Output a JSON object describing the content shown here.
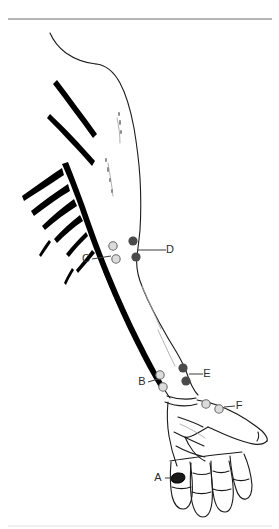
{
  "figure": {
    "kind": "anatomy-illustration",
    "width": 279,
    "height": 529,
    "background_color": "#ffffff",
    "top_rule": {
      "name": "horizontal-rule",
      "color": "#6e6e6e",
      "x1": 8,
      "x2": 272,
      "y": 19,
      "thickness": 1.2
    },
    "bottom_rule": {
      "name": "bottom-horizontal-rule",
      "color": "#d8d8d8",
      "x1": 8,
      "x2": 272,
      "y": 526,
      "thickness": 0.8
    },
    "colors": {
      "outline": "#1a1a1a",
      "nerve_tree": "#000000",
      "filled_marker": "#4a4a4a",
      "open_marker_fill": "#dcdcdc",
      "open_marker_stroke": "#6a6a6a",
      "label_text": "#2b2b2b",
      "leader_line": "#3a3a3a",
      "faint_detail": "#9a9a9a",
      "rule": "#6e6e6e"
    }
  },
  "markers": [
    {
      "id": "A",
      "label": "A",
      "type": "filled-band",
      "description": "dark band around the index finger proximal phalanx",
      "cx": 178,
      "cy": 478,
      "rx": 7,
      "ry": 5,
      "rotation": -12,
      "label_x": 158,
      "label_y": 478,
      "leader": {
        "x1": 165,
        "y1": 478,
        "x2": 172,
        "y2": 478
      }
    },
    {
      "id": "B",
      "label": "B",
      "type": "open-circles",
      "description": "two open circles on the ulnar side of the wrist",
      "circles": [
        {
          "cx": 160,
          "cy": 375,
          "r": 4.2
        },
        {
          "cx": 163,
          "cy": 387,
          "r": 4.2
        }
      ],
      "label_x": 142,
      "label_y": 382,
      "leader": {
        "x1": 148,
        "y1": 382,
        "x2": 158,
        "y2": 379
      }
    },
    {
      "id": "C",
      "label": "C",
      "type": "open-circles",
      "description": "two open circles medial to the elbow crease",
      "circles": [
        {
          "cx": 113,
          "cy": 246,
          "r": 4.2
        },
        {
          "cx": 116,
          "cy": 259,
          "r": 4.2
        }
      ],
      "label_x": 86,
      "label_y": 259,
      "leader": {
        "x1": 92,
        "y1": 259,
        "x2": 111,
        "y2": 256
      }
    },
    {
      "id": "D",
      "label": "D",
      "type": "filled-circles",
      "description": "two filled circles lateral to the elbow",
      "circles": [
        {
          "cx": 133,
          "cy": 241,
          "r": 4.6
        },
        {
          "cx": 136,
          "cy": 257,
          "r": 4.6
        }
      ],
      "label_x": 170,
      "label_y": 250,
      "leader": {
        "x1": 138,
        "y1": 250,
        "x2": 166,
        "y2": 250
      }
    },
    {
      "id": "E",
      "label": "E",
      "type": "filled-circles",
      "description": "two filled circles on the distal forearm near the wrist",
      "circles": [
        {
          "cx": 183,
          "cy": 368,
          "r": 4.6
        },
        {
          "cx": 186,
          "cy": 381,
          "r": 4.6
        }
      ],
      "label_x": 207,
      "label_y": 374,
      "leader": {
        "x1": 189,
        "y1": 374,
        "x2": 203,
        "y2": 374
      }
    },
    {
      "id": "F",
      "label": "F",
      "type": "open-circles",
      "description": "two open circles on the back of the hand near the thumb web",
      "circles": [
        {
          "cx": 206,
          "cy": 404,
          "r": 4.2
        },
        {
          "cx": 219,
          "cy": 409,
          "r": 4.2
        }
      ],
      "label_x": 239,
      "label_y": 406,
      "leader": {
        "x1": 224,
        "y1": 407,
        "x2": 235,
        "y2": 406
      }
    }
  ],
  "legend_order": [
    "A",
    "B",
    "C",
    "D",
    "E",
    "F"
  ]
}
